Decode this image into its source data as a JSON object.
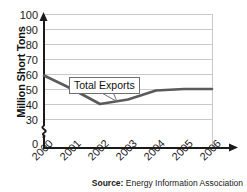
{
  "chart_data": {
    "type": "line",
    "title": "",
    "xlabel": "",
    "ylabel": "Million Short Tons",
    "x": [
      "2000",
      "2001",
      "2002",
      "2003",
      "2004",
      "2005",
      "2006"
    ],
    "series": [
      {
        "name": "Total Exports",
        "values": [
          59,
          50,
          40,
          43,
          49,
          50,
          50
        ]
      }
    ],
    "ylim": [
      30,
      100
    ],
    "yticks": [
      100,
      90,
      80,
      70,
      60,
      50,
      40,
      30,
      0
    ],
    "ytick_labels": [
      "100",
      "90",
      "80",
      "70",
      "60",
      "50",
      "40",
      "30",
      "0"
    ],
    "axis_break": true,
    "axis_break_between": [
      0,
      30
    ],
    "grid": "horizontal",
    "legend": "none",
    "annotations": [
      {
        "text": "Total Exports",
        "points_to_x": "2003",
        "points_to_y": 43
      }
    ],
    "line_color": "#5a5a5a",
    "grid_color": "#c9c9c9",
    "axis_color": "#1a1a1a"
  },
  "axis": {
    "y_title": "Million Short Tons",
    "ticks_y": [
      {
        "label": "100",
        "value": 100
      },
      {
        "label": "90",
        "value": 90
      },
      {
        "label": "80",
        "value": 80
      },
      {
        "label": "70",
        "value": 70
      },
      {
        "label": "60",
        "value": 60
      },
      {
        "label": "50",
        "value": 50
      },
      {
        "label": "40",
        "value": 40
      },
      {
        "label": "30",
        "value": 30
      },
      {
        "label": "0",
        "value": 0
      }
    ],
    "ticks_x": [
      {
        "label": "2000"
      },
      {
        "label": "2001"
      },
      {
        "label": "2002"
      },
      {
        "label": "2003"
      },
      {
        "label": "2004"
      },
      {
        "label": "2005"
      },
      {
        "label": "2006"
      }
    ]
  },
  "callout": {
    "label": "Total Exports"
  },
  "source": {
    "label": "Source:",
    "text": "Energy Information Association"
  }
}
